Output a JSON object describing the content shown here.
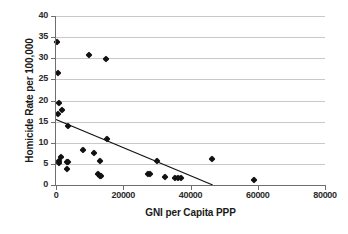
{
  "chart_data": {
    "type": "scatter",
    "title": "",
    "xlabel": "GNI per Capita PPP",
    "ylabel": "Homicide Rate per 100,000",
    "xlim": [
      0,
      80000
    ],
    "ylim": [
      0,
      40
    ],
    "xticks": [
      0,
      20000,
      40000,
      60000,
      80000
    ],
    "xtick_labels": [
      "0",
      "20000",
      "40000",
      "60000",
      "80000"
    ],
    "yticks": [
      0,
      5,
      10,
      15,
      20,
      25,
      30,
      35,
      40
    ],
    "ytick_labels": [
      "0",
      "5",
      "10",
      "15",
      "20",
      "25",
      "30",
      "35",
      "40"
    ],
    "grid": "horizontal",
    "legend": "none",
    "marker": "diamond",
    "marker_color": "#111111",
    "gridline_color": "#c9c9c9",
    "axis_color": "#6e6e6e",
    "points": [
      {
        "x": 400,
        "y": 33.9
      },
      {
        "x": 700,
        "y": 26.6
      },
      {
        "x": 900,
        "y": 19.4
      },
      {
        "x": 500,
        "y": 16.9
      },
      {
        "x": 1900,
        "y": 17.7
      },
      {
        "x": 3500,
        "y": 13.9
      },
      {
        "x": 9900,
        "y": 30.8
      },
      {
        "x": 14800,
        "y": 29.9
      },
      {
        "x": 15100,
        "y": 11.0
      },
      {
        "x": 7900,
        "y": 8.3
      },
      {
        "x": 11400,
        "y": 7.6
      },
      {
        "x": 1400,
        "y": 6.7
      },
      {
        "x": 900,
        "y": 5.7
      },
      {
        "x": 1000,
        "y": 5.2
      },
      {
        "x": 3300,
        "y": 5.5
      },
      {
        "x": 3600,
        "y": 5.4
      },
      {
        "x": 13100,
        "y": 5.7
      },
      {
        "x": 3200,
        "y": 3.8
      },
      {
        "x": 12600,
        "y": 2.5
      },
      {
        "x": 13100,
        "y": 2.2
      },
      {
        "x": 13400,
        "y": 2.1
      },
      {
        "x": 27400,
        "y": 2.7
      },
      {
        "x": 28000,
        "y": 2.6
      },
      {
        "x": 32400,
        "y": 2.0
      },
      {
        "x": 35300,
        "y": 1.7
      },
      {
        "x": 36200,
        "y": 1.7
      },
      {
        "x": 37200,
        "y": 1.6
      },
      {
        "x": 30000,
        "y": 5.6
      },
      {
        "x": 46400,
        "y": 6.2
      },
      {
        "x": 58800,
        "y": 1.2
      }
    ],
    "trendline": {
      "x0": 0,
      "y0": 15.5,
      "x1": 46600,
      "y1": 0.0,
      "color": "#111111"
    }
  }
}
